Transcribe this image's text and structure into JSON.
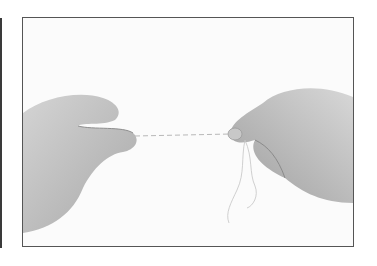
{
  "image": {
    "description": "Illustration photo of two hands holding a length of dental floss stretched horizontally, with loose floss hanging from the right hand",
    "frame_color": "#555555",
    "left_bar_color": "#3a3a3a",
    "skin_tone": "#bdbdbd",
    "background": "#fbfbfb"
  }
}
